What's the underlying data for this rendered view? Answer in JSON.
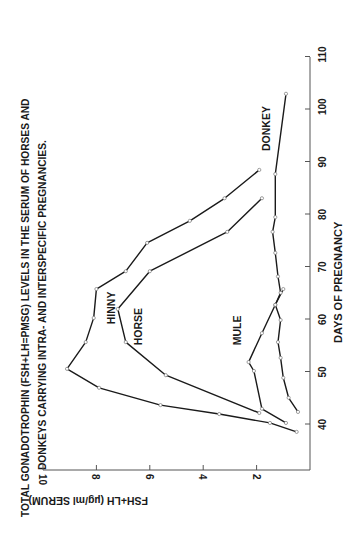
{
  "chart_data": {
    "type": "line",
    "orientation": "rotated 90deg counter-clockwise (x-axis runs up the right side)",
    "title": "TOTAL GONADOTROPHIN (FSH+LH=PMSG) LEVELS IN THE SERUM OF HORSES AND DONKEYS CARRYING INTRA- AND INTERSPECIFIC PREGNANCIES.",
    "title_lines": [
      "TOTAL  GONADOTROPHIN  (FSH+LH=PMSG)  LEVELS  IN  THE  SERUM  OF  HORSES  AND",
      "DONKEYS  CARRYING  INTRA-  AND  INTERSPECIFIC  PREGNANCIES."
    ],
    "xlabel": "DAYS OF PREGNANCY",
    "ylabel": "FSH+LH (µg/ml SERUM)",
    "xlim": [
      31,
      110
    ],
    "ylim": [
      0,
      10
    ],
    "xticks": [
      40,
      50,
      60,
      70,
      80,
      90,
      100,
      110
    ],
    "yticks": [
      2,
      4,
      6,
      8,
      10
    ],
    "grid": false,
    "legend": "inline labels",
    "series": [
      {
        "name": "HINNY",
        "points": [
          [
            38.5,
            0.5
          ],
          [
            40.2,
            1.5
          ],
          [
            41.9,
            3.4
          ],
          [
            43.6,
            5.6
          ],
          [
            46.9,
            7.9
          ],
          [
            50.5,
            9.1
          ],
          [
            55.6,
            8.4
          ],
          [
            60.2,
            8.1
          ],
          [
            65.7,
            8.0
          ],
          [
            69.1,
            6.9
          ],
          [
            74.5,
            6.1
          ],
          [
            78.7,
            4.5
          ],
          [
            83.0,
            3.2
          ],
          [
            88.4,
            1.9
          ]
        ]
      },
      {
        "name": "HORSE",
        "points": [
          [
            42.1,
            1.9
          ],
          [
            49.3,
            5.4
          ],
          [
            55.6,
            6.9
          ],
          [
            61.9,
            7.2
          ],
          [
            69.1,
            6.0
          ],
          [
            76.6,
            3.1
          ],
          [
            83.0,
            1.8
          ]
        ]
      },
      {
        "name": "MULE",
        "points": [
          [
            40.2,
            0.9
          ],
          [
            42.9,
            1.8
          ],
          [
            50.1,
            2.1
          ],
          [
            51.8,
            2.3
          ],
          [
            57.3,
            1.8
          ],
          [
            62.7,
            1.3
          ],
          [
            65.7,
            1.0
          ]
        ]
      },
      {
        "name": "DONKEY",
        "points": [
          [
            42.3,
            0.45
          ],
          [
            45.0,
            0.8
          ],
          [
            48.8,
            1.0
          ],
          [
            52.6,
            1.1
          ],
          [
            55.6,
            1.2
          ],
          [
            59.8,
            1.1
          ],
          [
            62.7,
            1.3
          ],
          [
            65.0,
            1.1
          ],
          [
            68.1,
            1.2
          ],
          [
            72.6,
            1.3
          ],
          [
            76.6,
            1.4
          ],
          [
            79.4,
            1.3
          ],
          [
            87.6,
            1.3
          ],
          [
            102.9,
            0.9
          ]
        ]
      }
    ],
    "annotations": [
      {
        "text": "HINNY",
        "at_day": 59,
        "at_value": 7.3
      },
      {
        "text": "HORSE",
        "at_day": 55,
        "at_value": 6.3
      },
      {
        "text": "MULE",
        "at_day": 55,
        "at_value": 2.6
      },
      {
        "text": "DONKEY",
        "at_day": 92,
        "at_value": 1.5
      }
    ]
  },
  "colors": {
    "line": "#1a1a1a",
    "marker_fill": "#ffffff",
    "marker_stroke": "#777777",
    "axis": "#555555",
    "background": "#ffffff"
  }
}
